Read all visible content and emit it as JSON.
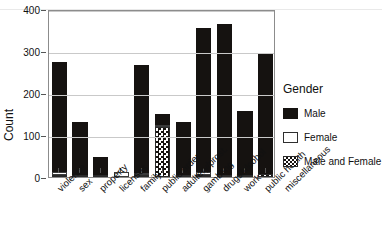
{
  "figure": {
    "cropped_title": "",
    "legend_title": "Gender"
  },
  "legend": {
    "title": "Gender",
    "entries": [
      {
        "label": "Male",
        "swatch": "black-fill",
        "color": "#151210"
      },
      {
        "label": "Female",
        "swatch": "white-fill",
        "color": "#ffffff"
      },
      {
        "label": "Male and Female",
        "swatch": "checkered-fill",
        "color": "#16120f"
      }
    ]
  },
  "chart_data": {
    "type": "bar",
    "subtype": "stacked",
    "title": "",
    "xlabel": "",
    "ylabel": "Count",
    "ylim": [
      0,
      400
    ],
    "yticks": [
      0,
      100,
      200,
      300,
      400
    ],
    "grid": true,
    "legend_position": "right",
    "legend_title": "Gender",
    "categories": [
      "violence",
      "sex",
      "property",
      "licenses",
      "family",
      "public order",
      "adultery/prost.",
      "gambling",
      "drugs/alcohol",
      "work",
      "public health"
    ],
    "series": [
      {
        "name": "Male",
        "color": "#151210",
        "values": [
          262,
          127,
          42,
          0,
          258,
          25,
          126,
          345,
          360,
          152,
          290
        ]
      },
      {
        "name": "Female",
        "color": "#ffffff",
        "values": [
          8,
          0,
          0,
          12,
          3,
          2,
          0,
          6,
          0,
          0,
          0
        ]
      },
      {
        "name": "Male and Female",
        "color": "#16120f",
        "values": [
          5,
          4,
          4,
          0,
          5,
          120,
          5,
          5,
          4,
          4,
          6
        ]
      }
    ],
    "totals": [
      275,
      131,
      46,
      12,
      266,
      147,
      131,
      356,
      364,
      156,
      296
    ]
  },
  "axes": {
    "y": {
      "label": "Count",
      "ticks": [
        "0",
        "100",
        "200",
        "300",
        "400"
      ]
    },
    "x": {
      "ticks": [
        "violence",
        "sex",
        "property",
        "licenses",
        "family",
        "public order",
        "adultery/prost.",
        "gambling",
        "drugs/alcohol",
        "work",
        "public health",
        "miscellaneous"
      ]
    }
  }
}
